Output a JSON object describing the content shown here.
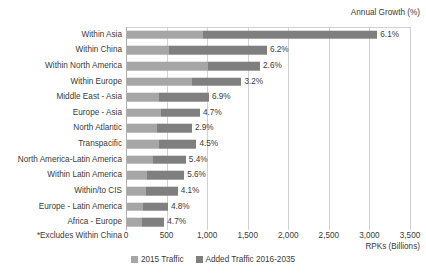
{
  "annotation_growth": "Annual Growth (%)",
  "footnote": "*Excludes Within China",
  "xaxis_title": "RPKs (Billions)",
  "legend": [
    {
      "label": "2015 Traffic",
      "color": "#a6a6a6",
      "name": "legend-2015-traffic"
    },
    {
      "label": "Added Traffic 2016-2035",
      "color": "#7f7f7f",
      "name": "legend-added-traffic"
    }
  ],
  "colors": {
    "base": "#a6a6a6",
    "added": "#7f7f7f",
    "gridline": "#d2d2d2",
    "text": "#3a3a3a",
    "background": "#ffffff"
  },
  "chart_data": {
    "type": "bar",
    "orientation": "horizontal",
    "stacked": true,
    "title": "",
    "subtitle": "",
    "xlabel": "RPKs (Billions)",
    "ylabel": "",
    "xlim": [
      0,
      3500
    ],
    "xticks": [
      0,
      500,
      1000,
      1500,
      2000,
      2500,
      3000,
      3500
    ],
    "xtick_labels": [
      "0",
      "500",
      "1,000",
      "1,500",
      "2,000",
      "2,500",
      "3,000",
      "3,500"
    ],
    "grid": true,
    "legend_position": "bottom-center",
    "annotation": "Annual Growth (%)",
    "footnote": "*Excludes Within China",
    "categories": [
      "Within Asia",
      "Within China",
      "Within North America",
      "Within Europe",
      "Middle East - Asia",
      "Europe - Asia",
      "North Atlantic",
      "Transpacific",
      "North America-Latin America",
      "Within Latin America",
      "Within/to CIS",
      "Europe - Latin America",
      "Africa - Europe"
    ],
    "series": [
      {
        "name": "2015 Traffic",
        "color": "#a6a6a6",
        "values": [
          940,
          520,
          1000,
          800,
          390,
          420,
          365,
          390,
          315,
          245,
          235,
          200,
          188
        ]
      },
      {
        "name": "Added Traffic 2016-2035",
        "color": "#7f7f7f",
        "values": [
          2145,
          1205,
          640,
          610,
          620,
          480,
          435,
          465,
          410,
          460,
          390,
          305,
          272
        ]
      }
    ],
    "totals": [
      3085,
      1725,
      1640,
      1410,
      1010,
      900,
      800,
      855,
      725,
      705,
      625,
      505,
      460
    ],
    "data_labels": {
      "name": "Annual Growth (%)",
      "values": [
        "6.1%",
        "6.2%",
        "2.6%",
        "3.2%",
        "6.9%",
        "4.7%",
        "2.9%",
        "4.5%",
        "5.4%",
        "5.6%",
        "4.1%",
        "4.8%",
        "4.7%"
      ]
    }
  }
}
